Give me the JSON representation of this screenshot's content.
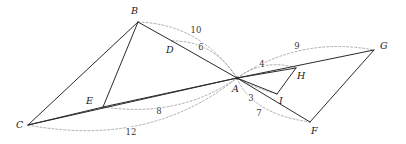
{
  "figure": {
    "width": 406,
    "height": 144,
    "background_color": "#ffffff",
    "edge_color": "#2b2b2b",
    "arc_color": "#9a9a9a",
    "label_color": "#1a1a1a"
  },
  "points": [
    {
      "id": "A",
      "label": "A",
      "x": 237,
      "y": 78,
      "label_x": 232,
      "label_y": 92,
      "dot": true
    },
    {
      "id": "B",
      "label": "B",
      "x": 138,
      "y": 22,
      "label_x": 131,
      "label_y": 14,
      "dot": false
    },
    {
      "id": "C",
      "label": "C",
      "x": 28,
      "y": 125,
      "label_x": 16,
      "label_y": 128,
      "dot": false
    },
    {
      "id": "D",
      "label": "D",
      "x": 172,
      "y": 41,
      "label_x": 166,
      "label_y": 53,
      "dot": false
    },
    {
      "id": "E",
      "label": "E",
      "x": 103,
      "y": 107,
      "label_x": 86,
      "label_y": 104,
      "dot": false
    },
    {
      "id": "F",
      "label": "F",
      "x": 310,
      "y": 122,
      "label_x": 311,
      "label_y": 134,
      "dot": false
    },
    {
      "id": "G",
      "label": "G",
      "x": 374,
      "y": 50,
      "label_x": 380,
      "label_y": 49,
      "dot": false
    },
    {
      "id": "H",
      "label": "H",
      "x": 296,
      "y": 68,
      "label_x": 297,
      "label_y": 79,
      "dot": false
    },
    {
      "id": "I",
      "label": "I",
      "x": 277,
      "y": 94,
      "label_x": 279,
      "label_y": 104,
      "dot": false
    }
  ],
  "segments": [
    {
      "id": "BC",
      "from": "B",
      "to": "C",
      "name": "segment-b-c"
    },
    {
      "id": "BD",
      "from": "B",
      "to": "D",
      "name": "segment-b-d"
    },
    {
      "id": "CE",
      "from": "C",
      "to": "E",
      "name": "segment-c-e"
    },
    {
      "id": "CA",
      "from": "C",
      "to": "A",
      "name": "segment-c-a"
    },
    {
      "id": "DA",
      "from": "D",
      "to": "A",
      "name": "segment-d-a"
    },
    {
      "id": "EA",
      "from": "E",
      "to": "A",
      "name": "segment-e-a"
    },
    {
      "id": "EB",
      "from": "E",
      "to": "B",
      "name": "segment-e-b"
    },
    {
      "id": "AH",
      "from": "A",
      "to": "H",
      "name": "segment-a-h"
    },
    {
      "id": "AG",
      "from": "A",
      "to": "G",
      "name": "segment-a-g"
    },
    {
      "id": "AI",
      "from": "A",
      "to": "I",
      "name": "segment-a-i"
    },
    {
      "id": "AF",
      "from": "A",
      "to": "F",
      "name": "segment-a-f"
    },
    {
      "id": "HI",
      "from": "H",
      "to": "I",
      "name": "segment-h-i"
    },
    {
      "id": "FG",
      "from": "F",
      "to": "G",
      "name": "segment-f-g"
    }
  ],
  "arcs": [
    {
      "id": "arc-10",
      "label": "10",
      "name": "arc-b-to-a",
      "from": "B",
      "to": "A",
      "path": "M 138 22 Q 200 24 237 78",
      "label_x": 196,
      "label_y": 33
    },
    {
      "id": "arc-6",
      "label": "6",
      "name": "arc-d-to-a",
      "from": "D",
      "to": "A",
      "path": "M 172 41 Q 212 40 237 78",
      "label_x": 201,
      "label_y": 50
    },
    {
      "id": "arc-8",
      "label": "8",
      "name": "arc-e-to-a",
      "from": "E",
      "to": "A",
      "path": "M 103 107 Q 180 118 237 78",
      "label_x": 159,
      "label_y": 114
    },
    {
      "id": "arc-12",
      "label": "12",
      "name": "arc-c-to-a",
      "from": "C",
      "to": "A",
      "path": "M 28 125 Q 150 148 237 78",
      "label_x": 131,
      "label_y": 135
    },
    {
      "id": "arc-9",
      "label": "9",
      "name": "arc-a-to-g",
      "from": "A",
      "to": "G",
      "path": "M 237 78 Q 300 36 374 50",
      "label_x": 297,
      "label_y": 49
    },
    {
      "id": "arc-4",
      "label": "4",
      "name": "arc-a-to-h",
      "from": "A",
      "to": "H",
      "path": "M 237 78 Q 265 58 296 68",
      "label_x": 262,
      "label_y": 67
    },
    {
      "id": "arc-3",
      "label": "3",
      "name": "arc-a-to-i",
      "from": "A",
      "to": "I",
      "path": "M 237 78 Q 255 88 277 94",
      "label_x": 251,
      "label_y": 101
    },
    {
      "id": "arc-7",
      "label": "7",
      "name": "arc-a-to-f",
      "from": "A",
      "to": "F",
      "path": "M 237 78 Q 252 114 310 122",
      "label_x": 259,
      "label_y": 116
    }
  ]
}
